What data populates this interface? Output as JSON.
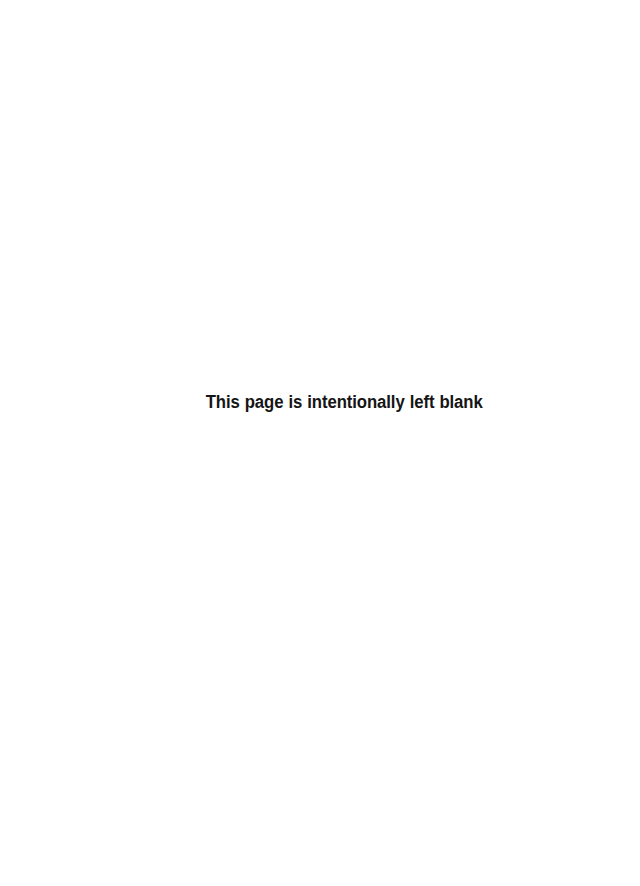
{
  "page": {
    "width_px": 640,
    "height_px": 886,
    "background_color": "#ffffff",
    "content_description": "blank-page"
  },
  "notice": {
    "text": "This page is intentionally left blank",
    "color": "#151515",
    "font_size_px": 18,
    "font_weight": "bold",
    "baseline_y_px": 409,
    "left_x_px": 210,
    "right_x_px": 482
  }
}
